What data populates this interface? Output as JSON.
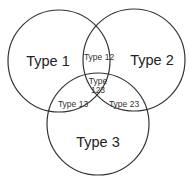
{
  "diagram": {
    "type": "venn",
    "stroke_color": "#333333",
    "background": "#ffffff",
    "sets": [
      {
        "id": "1",
        "label": "Type 1"
      },
      {
        "id": "2",
        "label": "Type 2"
      },
      {
        "id": "3",
        "label": "Type 3"
      }
    ],
    "intersections": [
      {
        "id": "12",
        "label": "Type 12"
      },
      {
        "id": "13",
        "label": "Type 13"
      },
      {
        "id": "23",
        "label": "Type 23"
      },
      {
        "id": "123",
        "label_line1": "Type",
        "label_line2": "123"
      }
    ]
  }
}
